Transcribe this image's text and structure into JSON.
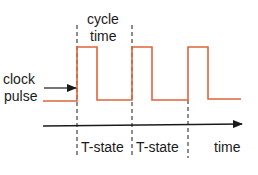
{
  "diagram": {
    "labels": {
      "cycle_time_line1": "cycle",
      "cycle_time_line2": "time",
      "clock_line1": "clock",
      "clock_line2": "pulse",
      "tstate_1": "T-state",
      "tstate_2": "T-state",
      "time_axis": "time"
    },
    "colors": {
      "waveform": "#e0643a",
      "lines": "#1a1a1a",
      "background": "#ffffff"
    },
    "waveform": {
      "low_level": "low",
      "high_level": "high",
      "pulses": 3
    }
  }
}
